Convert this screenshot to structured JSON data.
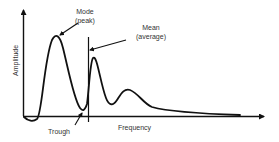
{
  "diagram": {
    "title": "",
    "axes": {
      "y_label": "Amplitude",
      "x_label": "Frequency"
    },
    "annotations": {
      "mode_line1": "Mode",
      "mode_line2": "(peak)",
      "mean_line1": "Mean",
      "mean_line2": "(average)",
      "trough": "Trough"
    },
    "colors": {
      "stroke": "#111111",
      "text": "#333333",
      "background": "#ffffff"
    }
  }
}
